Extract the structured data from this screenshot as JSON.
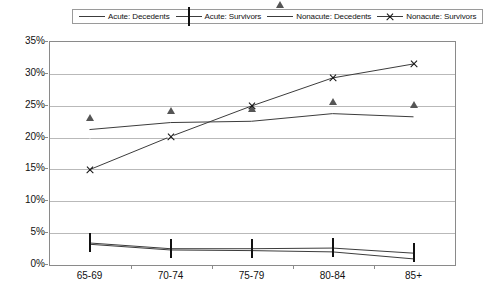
{
  "chart_data": {
    "type": "line",
    "title": "",
    "subtitle": "",
    "xlabel": "",
    "ylabel": "",
    "categories": [
      "65-69",
      "70-74",
      "75-79",
      "80-84",
      "85+"
    ],
    "ylim": [
      0,
      35
    ],
    "ytick_labels": [
      "0%",
      "5%",
      "10%",
      "15%",
      "20%",
      "25%",
      "30%",
      "35%"
    ],
    "ytick_values": [
      0,
      5,
      10,
      15,
      20,
      25,
      30,
      35
    ],
    "grid": true,
    "legend_position": "top-center",
    "value_suffix": "%",
    "series": [
      {
        "name": "Acute: Decedents",
        "marker": "filled-diamond",
        "values": [
          3.1,
          2.2,
          2.1,
          1.9,
          0.8
        ]
      },
      {
        "name": "Acute: Survivors",
        "marker": "open-square",
        "values": [
          3.3,
          2.4,
          2.4,
          2.5,
          1.7
        ]
      },
      {
        "name": "Nonacute: Decedents",
        "marker": "open-triangle",
        "values": [
          21.1,
          22.2,
          22.4,
          23.6,
          23.1
        ]
      },
      {
        "name": "Nonacute: Survivors",
        "marker": "cross",
        "values": [
          14.8,
          20.0,
          24.8,
          29.2,
          31.4
        ]
      }
    ],
    "colors": {
      "line": "#3c3c3c",
      "grid": "#b9b9b9",
      "axis": "#8a8a8a",
      "text": "#111111",
      "background": "#ffffff"
    }
  }
}
